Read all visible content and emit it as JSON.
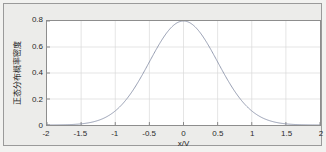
{
  "figure": {
    "background_color": "#ececea",
    "axes_background_color": "#ffffff",
    "axes_border_color": "#8d8d8d",
    "grid_color": "#d9d9d9",
    "curve_color": "#8a92a8"
  },
  "chart_data": {
    "type": "line",
    "title": "",
    "xlabel": "x/V",
    "ylabel": "正态分布概率密度",
    "xlim": [
      -2,
      2
    ],
    "ylim": [
      0,
      0.8
    ],
    "grid": true,
    "legend": null,
    "xticks": [
      "-2",
      "-1.5",
      "-1",
      "-0.5",
      "0",
      "0.5",
      "1",
      "1.5",
      "2"
    ],
    "xtick_values": [
      -2,
      -1.5,
      -1,
      -0.5,
      0,
      0.5,
      1,
      1.5,
      2
    ],
    "yticks": [
      "0",
      "0.2",
      "0.4",
      "0.6",
      "0.8"
    ],
    "ytick_values": [
      0,
      0.2,
      0.4,
      0.6,
      0.8
    ],
    "series": [
      {
        "name": "正态分布概率密度",
        "color": "#8a92a8",
        "mu": 0,
        "sigma": 0.5,
        "peak": 0.8,
        "x": [
          -2,
          -1.9,
          -1.8,
          -1.7,
          -1.6,
          -1.5,
          -1.4,
          -1.3,
          -1.2,
          -1.1,
          -1,
          -0.9,
          -0.8,
          -0.7,
          -0.6,
          -0.5,
          -0.4,
          -0.3,
          -0.2,
          -0.1,
          0,
          0.1,
          0.2,
          0.3,
          0.4,
          0.5,
          0.6,
          0.7,
          0.8,
          0.9,
          1,
          1.1,
          1.2,
          1.3,
          1.4,
          1.5,
          1.6,
          1.7,
          1.8,
          1.9,
          2
        ],
        "values": [
          0.0002,
          0.0005,
          0.0011,
          0.0024,
          0.0048,
          0.0089,
          0.0158,
          0.0265,
          0.0421,
          0.0632,
          0.0899,
          0.1211,
          0.1545,
          0.1866,
          0.2134,
          0.2311,
          0.2369,
          0.2311,
          0.2134,
          0.1866,
          0.1545,
          0.1211,
          0.0899,
          0.0632,
          0.0421,
          0.0265,
          0.0158,
          0.0089,
          0.0048,
          0.0024,
          0.0011,
          0.0005,
          0.0002,
          0.0001,
          0.0,
          0.0,
          0.0,
          0.0,
          0.0,
          0.0,
          0.0
        ],
        "values_scaled": [
          0.0006,
          0.0016,
          0.0037,
          0.0081,
          0.0162,
          0.0301,
          0.0532,
          0.0895,
          0.1421,
          0.2133,
          0.3036,
          0.4089,
          0.5216,
          0.63,
          0.7205,
          0.7803,
          0.8,
          0.7803,
          0.7205,
          0.63,
          0.5216,
          0.4089,
          0.3036,
          0.2133,
          0.1421,
          0.0895,
          0.0532,
          0.0301,
          0.0162,
          0.0081,
          0.0037,
          0.0016,
          0.0006,
          0.0002,
          0.0001,
          0.0,
          0.0,
          0.0,
          0.0,
          0.0,
          0.0
        ]
      }
    ]
  }
}
